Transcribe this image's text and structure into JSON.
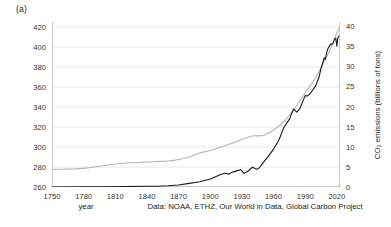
{
  "panel": {
    "label": "(a)"
  },
  "axes": {
    "x_label": "year",
    "y_left_label": "atmospheric CO₂ (ppm)",
    "y_right_label": "CO₂ emissions (billions of tons)",
    "x_ticks": [
      1750,
      1780,
      1810,
      1840,
      1870,
      1900,
      1930,
      1960,
      1990,
      2020
    ],
    "y_left_ticks": [
      260,
      280,
      300,
      320,
      340,
      360,
      380,
      400,
      420
    ],
    "y_right_ticks": [
      0,
      5,
      10,
      15,
      20,
      25,
      30,
      35,
      40
    ]
  },
  "caption": "Data: NOAA, ETHZ, Our World in Data, Global Carbon Project",
  "colors": {
    "co2_concentration_line": "#b4b4b4",
    "emissions_line": "#1a1a1a",
    "grid": "#e2e2e2",
    "axis": "#8c8c8c",
    "text": "#1a1a1a"
  },
  "chart_data": {
    "type": "line",
    "title": "",
    "xlabel": "year",
    "xlim": [
      1750,
      2023
    ],
    "grid": true,
    "legend": "none",
    "axes_note": "Dual y-axis: light gray smooth curve on left axis (atmospheric CO2 ppm); dark jagged curve on right axis (CO2 emissions, billions of tons).",
    "series": [
      {
        "name": "atmospheric CO₂ (ppm)",
        "axis": "left",
        "ylabel": "atmospheric CO₂ (ppm)",
        "ylim": [
          260,
          425
        ],
        "color": "#b4b4b4",
        "x": [
          1750,
          1760,
          1770,
          1780,
          1790,
          1800,
          1810,
          1820,
          1830,
          1840,
          1850,
          1860,
          1870,
          1880,
          1890,
          1900,
          1910,
          1920,
          1930,
          1940,
          1950,
          1960,
          1970,
          1980,
          1990,
          2000,
          2010,
          2015,
          2020,
          2022
        ],
        "y": [
          277.5,
          277.8,
          278.0,
          278.6,
          280.0,
          281.5,
          283.0,
          284.0,
          284.3,
          285.0,
          285.5,
          286.0,
          287.5,
          290.0,
          294.0,
          296.5,
          300.0,
          303.5,
          307.5,
          311.0,
          311.5,
          317.0,
          325.5,
          338.5,
          354.0,
          369.5,
          389.5,
          400.5,
          414.0,
          418.5
        ]
      },
      {
        "name": "CO₂ emissions (billions of tons)",
        "axis": "right",
        "ylabel": "CO₂ emissions (billions of tons)",
        "ylim": [
          0,
          41
        ],
        "color": "#1a1a1a",
        "x": [
          1750,
          1780,
          1800,
          1820,
          1840,
          1850,
          1860,
          1870,
          1880,
          1890,
          1900,
          1910,
          1914,
          1918,
          1920,
          1925,
          1929,
          1932,
          1935,
          1940,
          1944,
          1946,
          1950,
          1955,
          1960,
          1965,
          1970,
          1975,
          1979,
          1982,
          1985,
          1990,
          1992,
          1995,
          2000,
          2003,
          2005,
          2008,
          2009,
          2011,
          2014,
          2016,
          2018,
          2019,
          2020,
          2021,
          2022
        ],
        "y": [
          0.01,
          0.03,
          0.05,
          0.1,
          0.2,
          0.2,
          0.3,
          0.5,
          0.9,
          1.3,
          2.0,
          3.1,
          3.4,
          3.2,
          3.6,
          4.0,
          4.3,
          3.4,
          3.8,
          4.9,
          4.4,
          4.6,
          6.0,
          7.6,
          9.4,
          11.6,
          14.9,
          16.8,
          19.4,
          18.6,
          19.5,
          22.7,
          22.6,
          23.3,
          25.2,
          27.2,
          29.4,
          32.1,
          31.7,
          34.1,
          35.5,
          35.5,
          36.8,
          37.0,
          35.0,
          37.1,
          37.5
        ]
      }
    ]
  }
}
